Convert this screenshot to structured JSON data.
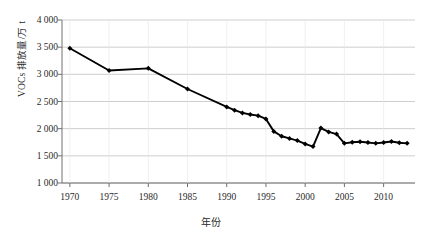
{
  "chart_data": {
    "type": "line",
    "title": "",
    "xlabel": "年份",
    "ylabel": "VOCs 排放量/万 t",
    "xlim": [
      1969,
      2014
    ],
    "ylim": [
      1000,
      4000
    ],
    "grid": true,
    "legend": "none",
    "marker": "diamond",
    "line_color": "#000000",
    "grid_color": "#c8c8c8",
    "axis_color": "#808080",
    "xticks": [
      "1970",
      "1975",
      "1980",
      "1985",
      "1990",
      "1995",
      "2000",
      "2005",
      "2010"
    ],
    "xtick_values": [
      1970,
      1975,
      1980,
      1985,
      1990,
      1995,
      2000,
      2005,
      2010
    ],
    "yticks": [
      "1 000",
      "1 500",
      "2 000",
      "2 500",
      "3 000",
      "3 500",
      "4 000"
    ],
    "ytick_values": [
      1000,
      1500,
      2000,
      2500,
      3000,
      3500,
      4000
    ],
    "x": [
      1970,
      1975,
      1980,
      1985,
      1990,
      1991,
      1992,
      1993,
      1994,
      1995,
      1996,
      1997,
      1998,
      1999,
      2000,
      2001,
      2002,
      2003,
      2004,
      2005,
      2006,
      2007,
      2008,
      2009,
      2010,
      2011,
      2012,
      2013
    ],
    "values": [
      3480,
      3070,
      3110,
      2730,
      2400,
      2340,
      2290,
      2260,
      2240,
      2180,
      1950,
      1860,
      1820,
      1780,
      1720,
      1670,
      2010,
      1940,
      1900,
      1730,
      1750,
      1760,
      1745,
      1730,
      1745,
      1765,
      1740,
      1730
    ],
    "series": [
      {
        "name": "VOCs 排放量",
        "values": [
          3480,
          3070,
          3110,
          2730,
          2400,
          2340,
          2290,
          2260,
          2240,
          2180,
          1950,
          1860,
          1820,
          1780,
          1720,
          1670,
          2010,
          1940,
          1900,
          1730,
          1750,
          1760,
          1745,
          1730,
          1745,
          1765,
          1740,
          1730
        ]
      }
    ]
  }
}
